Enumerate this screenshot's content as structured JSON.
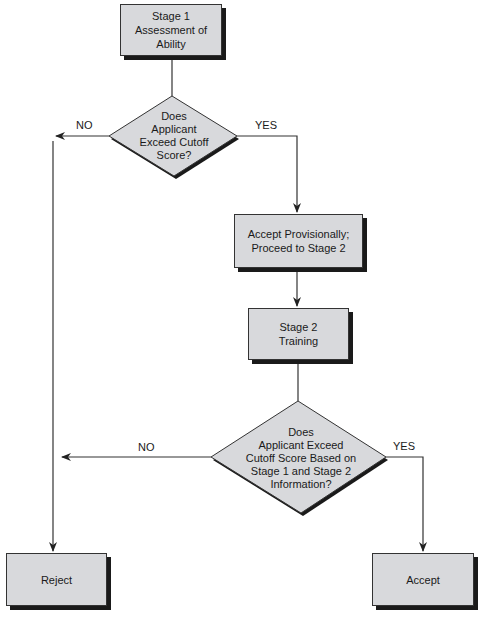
{
  "flowchart": {
    "nodes": {
      "stage1": {
        "type": "process",
        "label": "Stage 1\nAssessment of\nAbility"
      },
      "decision1": {
        "type": "decision",
        "label": "Does\nApplicant\nExceed Cutoff\nScore?"
      },
      "accept_provisional": {
        "type": "process",
        "label": "Accept Provisionally;\nProceed to Stage 2"
      },
      "stage2": {
        "type": "process",
        "label": "Stage 2\nTraining"
      },
      "decision2": {
        "type": "decision",
        "label": "Does\nApplicant Exceed\nCutoff Score Based on\nStage 1 and Stage 2\nInformation?"
      },
      "reject": {
        "type": "terminal",
        "label": "Reject"
      },
      "accept": {
        "type": "terminal",
        "label": "Accept"
      }
    },
    "edges": {
      "d1_no": {
        "from": "decision1",
        "to": "reject",
        "label": "NO"
      },
      "d1_yes": {
        "from": "decision1",
        "to": "accept_provisional",
        "label": "YES"
      },
      "d2_no": {
        "from": "decision2",
        "to": "reject",
        "label": "NO"
      },
      "d2_yes": {
        "from": "decision2",
        "to": "accept",
        "label": "YES"
      }
    }
  },
  "colors": {
    "node_fill": "#d8d9dc",
    "shadow": "#1a1a1a",
    "line": "#333333"
  }
}
